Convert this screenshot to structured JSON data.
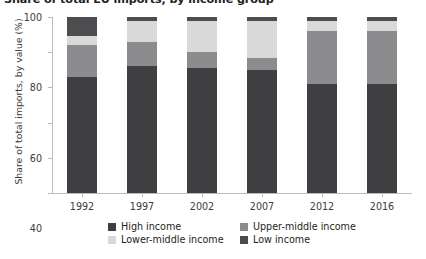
{
  "chart_data": {
    "type": "bar",
    "subtype": "stacked-column-100",
    "title": "Share of total EU imports, by income group",
    "xlabel": "",
    "ylabel": "Share of total imports, by value (%)",
    "categories": [
      "1992",
      "1997",
      "2002",
      "2007",
      "2012",
      "2016"
    ],
    "ylim": [
      0,
      100
    ],
    "yticks": [
      0,
      20,
      40,
      60,
      80,
      100
    ],
    "ytick_labels": [
      "0",
      "20",
      "40",
      "60",
      "80",
      "100"
    ],
    "grid": false,
    "legend_position": "bottom",
    "series": [
      {
        "name": "High income",
        "color": "#3f3f41",
        "values": [
          66,
          72,
          71,
          70,
          62,
          62
        ]
      },
      {
        "name": "Upper-middle income",
        "color": "#8c8c8e",
        "values": [
          18,
          14,
          9,
          7,
          30,
          30
        ]
      },
      {
        "name": "Lower-middle income",
        "color": "#d9d9d9",
        "values": [
          5,
          12,
          18,
          21,
          6,
          6
        ]
      },
      {
        "name": "Low income",
        "color": "#4d4d4f",
        "values": [
          11,
          2,
          2,
          2,
          2,
          2
        ]
      }
    ]
  },
  "legend": {
    "rows": [
      [
        {
          "label": "High income",
          "color": "#3f3f41",
          "icon": "legend-swatch-high-income"
        },
        {
          "label": "Upper-middle income",
          "color": "#8c8c8e",
          "icon": "legend-swatch-upper-middle-income"
        }
      ],
      [
        {
          "label": "Lower-middle income",
          "color": "#d9d9d9",
          "icon": "legend-swatch-lower-middle-income"
        },
        {
          "label": "Low income",
          "color": "#4d4d4f",
          "icon": "legend-swatch-low-income"
        }
      ]
    ]
  },
  "axis_colors": {
    "line": "#bcbcbc",
    "tick_text": "#3b3b3b",
    "title_text": "#231f20"
  }
}
